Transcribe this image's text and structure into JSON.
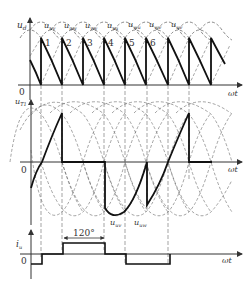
{
  "figure": {
    "type": "three-phase bridge rectifier waveforms",
    "panels": [
      {
        "id": "output-voltage",
        "ylabel": "u_d",
        "ylabel_main": "u",
        "ylabel_sub": "d",
        "xlabel": "ωt",
        "origin_label": "0",
        "line_voltage_labels": [
          {
            "main": "u",
            "sub": "uv"
          },
          {
            "main": "u",
            "sub": "uw"
          },
          {
            "main": "u",
            "sub": "vw"
          },
          {
            "main": "u",
            "sub": "vu"
          },
          {
            "main": "u",
            "sub": "wu"
          },
          {
            "main": "u",
            "sub": "wv"
          },
          {
            "main": "u",
            "sub": "uv"
          }
        ],
        "interval_numbers": [
          "1",
          "2",
          "3",
          "4",
          "5",
          "6"
        ]
      },
      {
        "id": "thyristor-voltage",
        "ylabel_main": "u",
        "ylabel_sub": "T1",
        "xlabel": "ωt",
        "origin_label": "0",
        "annotations": [
          {
            "main": "u",
            "sub": "uv"
          },
          {
            "main": "u",
            "sub": "uw"
          }
        ]
      },
      {
        "id": "phase-current",
        "ylabel_main": "i",
        "ylabel_sub": "u",
        "xlabel": "ωt",
        "origin_label": "0",
        "pulse_width_label": "120°"
      }
    ]
  }
}
